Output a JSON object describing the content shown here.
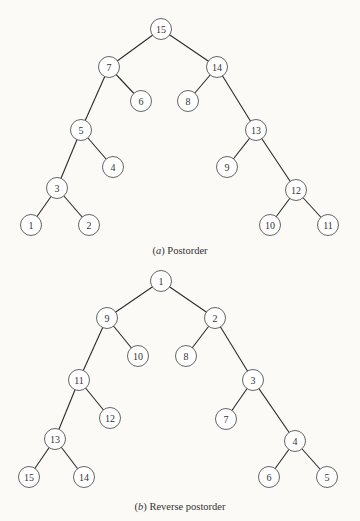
{
  "figures": [
    {
      "id": "a",
      "caption_label": "a",
      "caption_text": "Postorder",
      "nodes": [
        {
          "label": "15",
          "children": [
            "7",
            "14"
          ]
        },
        {
          "label": "7",
          "children": [
            "5",
            "6"
          ]
        },
        {
          "label": "14",
          "children": [
            "8",
            "13"
          ]
        },
        {
          "label": "6",
          "children": []
        },
        {
          "label": "8",
          "children": []
        },
        {
          "label": "5",
          "children": [
            "3",
            "4"
          ]
        },
        {
          "label": "13",
          "children": [
            "9",
            "12"
          ]
        },
        {
          "label": "4",
          "children": []
        },
        {
          "label": "9",
          "children": []
        },
        {
          "label": "3",
          "children": [
            "1",
            "2"
          ]
        },
        {
          "label": "12",
          "children": [
            "10",
            "11"
          ]
        },
        {
          "label": "1",
          "children": []
        },
        {
          "label": "2",
          "children": []
        },
        {
          "label": "10",
          "children": []
        },
        {
          "label": "11",
          "children": []
        }
      ]
    },
    {
      "id": "b",
      "caption_label": "b",
      "caption_text": "Reverse postorder",
      "nodes": [
        {
          "label": "1",
          "children": [
            "9",
            "2"
          ]
        },
        {
          "label": "9",
          "children": [
            "11",
            "10"
          ]
        },
        {
          "label": "2",
          "children": [
            "8",
            "3"
          ]
        },
        {
          "label": "10",
          "children": []
        },
        {
          "label": "8",
          "children": []
        },
        {
          "label": "11",
          "children": [
            "13",
            "12"
          ]
        },
        {
          "label": "3",
          "children": [
            "7",
            "4"
          ]
        },
        {
          "label": "12",
          "children": []
        },
        {
          "label": "7",
          "children": []
        },
        {
          "label": "13",
          "children": [
            "15",
            "14"
          ]
        },
        {
          "label": "4",
          "children": [
            "6",
            "5"
          ]
        },
        {
          "label": "15",
          "children": []
        },
        {
          "label": "14",
          "children": []
        },
        {
          "label": "6",
          "children": []
        },
        {
          "label": "5",
          "children": []
        }
      ]
    }
  ]
}
